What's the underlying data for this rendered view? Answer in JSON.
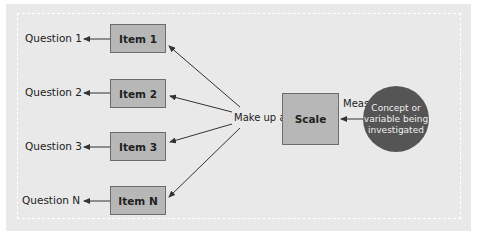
{
  "diagram": {
    "questions": [
      "Question 1",
      "Question 2",
      "Question 3",
      "Question N"
    ],
    "items": [
      "Item 1",
      "Item 2",
      "Item 3",
      "Item N"
    ],
    "make_up_label": "Make up a",
    "scale_label": "Scale",
    "measures_label": "Measures a",
    "concept_label": "Concept or variable being investigated",
    "colors": {
      "panel": "#e9e9e9",
      "box_fill": "#b7b7b7",
      "box_border": "#6d6d6d",
      "circle_fill": "#555555",
      "circle_text": "#efefef",
      "arrow": "#333333"
    }
  }
}
